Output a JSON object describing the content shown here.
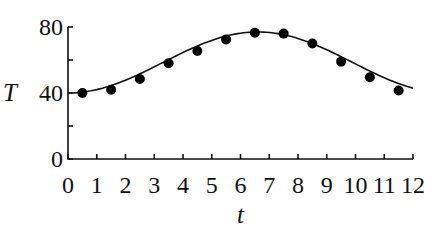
{
  "chart_data": {
    "type": "scatter",
    "title": "",
    "xlabel": "t",
    "ylabel": "T",
    "xlim": [
      0,
      12
    ],
    "ylim": [
      0,
      80
    ],
    "x_ticks": [
      0,
      1,
      2,
      3,
      4,
      5,
      6,
      7,
      8,
      9,
      10,
      11,
      12
    ],
    "y_ticks_labeled": [
      0,
      40,
      80
    ],
    "y_ticks_minor": [
      20,
      60
    ],
    "grid": false,
    "legend": null,
    "series": [
      {
        "name": "data points",
        "type": "scatter",
        "x": [
          0.5,
          1.5,
          2.5,
          3.5,
          4.5,
          5.5,
          6.5,
          7.5,
          8.5,
          9.5,
          10.5,
          11.5
        ],
        "y": [
          40,
          42,
          48.5,
          58,
          65.5,
          72.5,
          76.5,
          76,
          70,
          59,
          49.5,
          41.5
        ]
      },
      {
        "name": "fitted curve",
        "type": "line",
        "x": [
          0,
          0.5,
          1,
          1.5,
          2,
          2.5,
          3,
          3.5,
          4,
          4.5,
          5,
          5.5,
          6,
          6.5,
          7,
          7.5,
          8,
          8.5,
          9,
          9.5,
          10,
          10.5,
          11,
          11.5,
          12
        ],
        "y": [
          40,
          40.3,
          41.3,
          42.8,
          44.9,
          47.4,
          50.3,
          53.4,
          56.6,
          59.8,
          63.0,
          66.1,
          69.0,
          71.6,
          73.8,
          75.5,
          76.6,
          77.0,
          76.6,
          75.2,
          72.6,
          68.6,
          63.5,
          57.5,
          42.0
        ]
      }
    ]
  },
  "axes": {
    "x_label": "t",
    "y_label": "T"
  }
}
